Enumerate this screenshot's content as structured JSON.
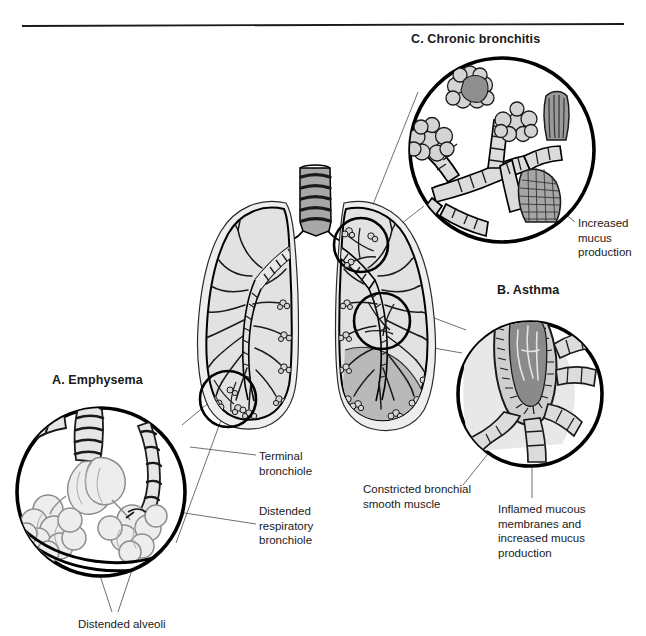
{
  "figure": {
    "divider": true
  },
  "panels": [
    {
      "key": "emphysema",
      "label": "A.  Emphysema"
    },
    {
      "key": "asthma",
      "label": "B.  Asthma"
    },
    {
      "key": "bronchitis",
      "label": "C.  Chronic bronchitis"
    }
  ],
  "labels": {
    "chronic_bronchitis": "C.  Chronic bronchitis",
    "asthma": "B.  Asthma",
    "emphysema": "A.  Emphysema",
    "increased_mucus": "Increased\nmucus\nproduction",
    "terminal_bronchiole": "Terminal\nbronchiole",
    "distended_respiratory_bronchiole": "Distended\nrespiratory\nbronchiole",
    "constricted_muscle": "Constricted bronchial\nsmooth muscle",
    "inflamed_membranes": "Inflamed mucous\nmembranes and\nincreased mucus\nproduction",
    "distended_alveoli": "Distended alveoli"
  },
  "colors": {
    "ink": "#1a1a1a",
    "outline": "#000000",
    "lung_fill": "#e2e2e2",
    "lung_fill_dark": "#b9b9b9",
    "cartilage": "#a8a8a8",
    "alveoli_fill": "#d0d0d0",
    "alveoli_pale": "#ececec",
    "mucus": "#8c8c8c",
    "leader": "#555555",
    "background": "#ffffff"
  }
}
